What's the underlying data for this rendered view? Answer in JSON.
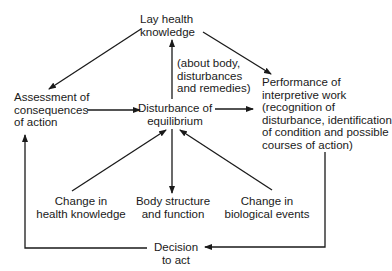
{
  "diagram": {
    "type": "flow",
    "nodes": {
      "lay_health": {
        "lines": [
          "Lay health",
          "knowledge"
        ]
      },
      "about_note": {
        "lines": [
          "(about body,",
          "disturbances",
          "and remedies)"
        ]
      },
      "assessment": {
        "lines": [
          "Assessment of",
          "consequences",
          "of action"
        ]
      },
      "disturbance": {
        "lines": [
          "Disturbance of",
          "equilibrium"
        ]
      },
      "performance": {
        "lines": [
          "Performance of",
          "interpretive work",
          "(recognition of",
          "disturbance, identification",
          "of condition and possible",
          "courses of action)"
        ]
      },
      "change_knowledge": {
        "lines": [
          "Change in",
          "health knowledge"
        ]
      },
      "body_structure": {
        "lines": [
          "Body structure",
          "and function"
        ]
      },
      "change_biological": {
        "lines": [
          "Change in",
          "biological events"
        ]
      },
      "decision": {
        "lines": [
          "Decision",
          "to act"
        ]
      }
    },
    "edges": [
      {
        "from": "lay_health",
        "to": "assessment"
      },
      {
        "from": "lay_health",
        "to": "performance"
      },
      {
        "from": "disturbance",
        "to": "lay_health",
        "label": "about_note"
      },
      {
        "from": "assessment",
        "to": "disturbance"
      },
      {
        "from": "disturbance",
        "to": "performance"
      },
      {
        "from": "change_knowledge",
        "to": "disturbance"
      },
      {
        "from": "disturbance",
        "to": "body_structure"
      },
      {
        "from": "change_biological",
        "to": "disturbance"
      },
      {
        "from": "performance",
        "to": "decision"
      },
      {
        "from": "decision",
        "to": "assessment"
      }
    ],
    "colors": {
      "line": "#1a1a1a",
      "background": "#ffffff"
    }
  }
}
